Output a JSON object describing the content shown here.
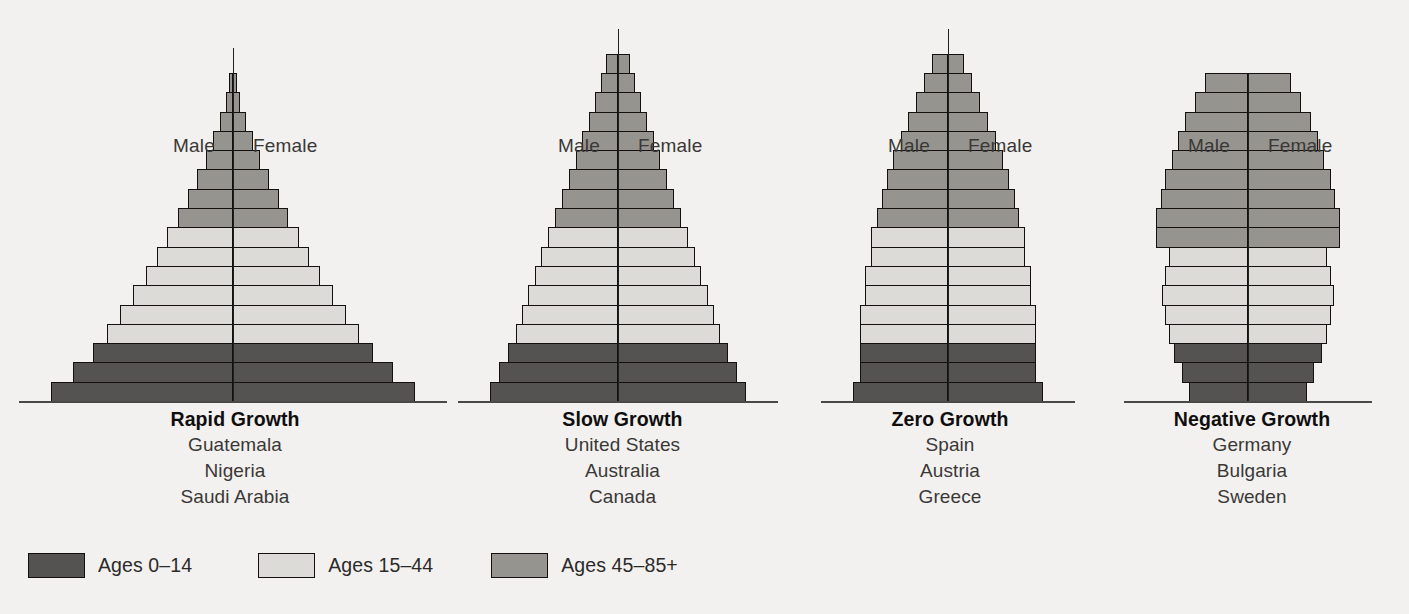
{
  "chart_data": {
    "type": "bar",
    "chart_kind": "population-pyramid",
    "title": "",
    "xlabel": "",
    "ylabel": "",
    "grid": false,
    "legend_position": "bottom-left",
    "side_labels": {
      "left": "Male",
      "right": "Female"
    },
    "age_groups": [
      {
        "key": "young",
        "label": "Ages 0–14",
        "color": "#555352"
      },
      {
        "key": "middle",
        "label": "Ages 15–44",
        "color": "#dcdbd8"
      },
      {
        "key": "older",
        "label": "Ages 45–85+",
        "color": "#96948f"
      }
    ],
    "pyramids": [
      {
        "title": "Rapid Growth",
        "countries": [
          "Guatemala",
          "Nigeria",
          "Saudi Arabia"
        ],
        "bands": [
          {
            "width_pct": 100,
            "group": "young"
          },
          {
            "width_pct": 88,
            "group": "young"
          },
          {
            "width_pct": 77,
            "group": "young"
          },
          {
            "width_pct": 69,
            "group": "middle"
          },
          {
            "width_pct": 62,
            "group": "middle"
          },
          {
            "width_pct": 55,
            "group": "middle"
          },
          {
            "width_pct": 48,
            "group": "middle"
          },
          {
            "width_pct": 42,
            "group": "middle"
          },
          {
            "width_pct": 36,
            "group": "middle"
          },
          {
            "width_pct": 30,
            "group": "older"
          },
          {
            "width_pct": 25,
            "group": "older"
          },
          {
            "width_pct": 20,
            "group": "older"
          },
          {
            "width_pct": 15,
            "group": "older"
          },
          {
            "width_pct": 11,
            "group": "older"
          },
          {
            "width_pct": 7,
            "group": "older"
          },
          {
            "width_pct": 4,
            "group": "older"
          },
          {
            "width_pct": 2,
            "group": "older"
          }
        ]
      },
      {
        "title": "Slow Growth",
        "countries": [
          "United States",
          "Australia",
          "Canada"
        ],
        "bands": [
          {
            "width_pct": 100,
            "group": "young"
          },
          {
            "width_pct": 93,
            "group": "young"
          },
          {
            "width_pct": 86,
            "group": "young"
          },
          {
            "width_pct": 80,
            "group": "middle"
          },
          {
            "width_pct": 75,
            "group": "middle"
          },
          {
            "width_pct": 70,
            "group": "middle"
          },
          {
            "width_pct": 65,
            "group": "middle"
          },
          {
            "width_pct": 60,
            "group": "middle"
          },
          {
            "width_pct": 55,
            "group": "middle"
          },
          {
            "width_pct": 49,
            "group": "older"
          },
          {
            "width_pct": 44,
            "group": "older"
          },
          {
            "width_pct": 38,
            "group": "older"
          },
          {
            "width_pct": 33,
            "group": "older"
          },
          {
            "width_pct": 28,
            "group": "older"
          },
          {
            "width_pct": 23,
            "group": "older"
          },
          {
            "width_pct": 18,
            "group": "older"
          },
          {
            "width_pct": 13,
            "group": "older"
          },
          {
            "width_pct": 9,
            "group": "older"
          }
        ]
      },
      {
        "title": "Zero Growth",
        "countries": [
          "Spain",
          "Austria",
          "Greece"
        ],
        "bands": [
          {
            "width_pct": 100,
            "group": "young"
          },
          {
            "width_pct": 93,
            "group": "young"
          },
          {
            "width_pct": 93,
            "group": "young"
          },
          {
            "width_pct": 93,
            "group": "middle"
          },
          {
            "width_pct": 93,
            "group": "middle"
          },
          {
            "width_pct": 87,
            "group": "middle"
          },
          {
            "width_pct": 87,
            "group": "middle"
          },
          {
            "width_pct": 81,
            "group": "middle"
          },
          {
            "width_pct": 81,
            "group": "middle"
          },
          {
            "width_pct": 75,
            "group": "older"
          },
          {
            "width_pct": 70,
            "group": "older"
          },
          {
            "width_pct": 64,
            "group": "older"
          },
          {
            "width_pct": 58,
            "group": "older"
          },
          {
            "width_pct": 50,
            "group": "older"
          },
          {
            "width_pct": 42,
            "group": "older"
          },
          {
            "width_pct": 34,
            "group": "older"
          },
          {
            "width_pct": 25,
            "group": "older"
          },
          {
            "width_pct": 17,
            "group": "older"
          }
        ]
      },
      {
        "title": "Negative Growth",
        "countries": [
          "Germany",
          "Bulgaria",
          "Sweden"
        ],
        "bands": [
          {
            "width_pct": 64,
            "group": "young"
          },
          {
            "width_pct": 72,
            "group": "young"
          },
          {
            "width_pct": 80,
            "group": "young"
          },
          {
            "width_pct": 86,
            "group": "middle"
          },
          {
            "width_pct": 90,
            "group": "middle"
          },
          {
            "width_pct": 93,
            "group": "middle"
          },
          {
            "width_pct": 90,
            "group": "middle"
          },
          {
            "width_pct": 86,
            "group": "middle"
          },
          {
            "width_pct": 100,
            "group": "older"
          },
          {
            "width_pct": 100,
            "group": "older"
          },
          {
            "width_pct": 95,
            "group": "older"
          },
          {
            "width_pct": 90,
            "group": "older"
          },
          {
            "width_pct": 83,
            "group": "older"
          },
          {
            "width_pct": 76,
            "group": "older"
          },
          {
            "width_pct": 68,
            "group": "older"
          },
          {
            "width_pct": 58,
            "group": "older"
          },
          {
            "width_pct": 47,
            "group": "older"
          }
        ]
      }
    ]
  }
}
